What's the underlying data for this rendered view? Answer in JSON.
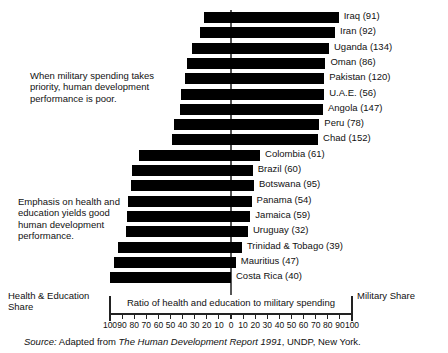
{
  "chart_data": {
    "type": "bar",
    "title": "",
    "subtitle": "",
    "orientation": "horizontal-diverging",
    "xlabel": "Ratio of health and education to military spending",
    "ylabel": "",
    "xlim": [
      -100,
      100
    ],
    "grid": false,
    "legend": "none",
    "axis_note_left": "Health & Education\nShare",
    "axis_note_right": "Military Share",
    "tick_labels": [
      "100",
      "90",
      "80",
      "70",
      "60",
      "50",
      "40",
      "30",
      "20",
      "10",
      "0",
      "10",
      "20",
      "30",
      "40",
      "50",
      "60",
      "70",
      "80",
      "90",
      "100"
    ],
    "tick_values": [
      -100,
      -90,
      -80,
      -70,
      -60,
      -50,
      -40,
      -30,
      -20,
      -10,
      0,
      10,
      20,
      30,
      40,
      50,
      60,
      70,
      80,
      90,
      100
    ],
    "series_note": "Bars extending right indicate a larger military share; bars extending left indicate a larger health & education share. Number in parentheses is the country's human development rank.",
    "categories": [
      "Iraq (91)",
      "Iran (92)",
      "Uganda (134)",
      "Oman (86)",
      "Pakistan (120)",
      "U.A.E. (56)",
      "Angola (147)",
      "Peru (78)",
      "Chad (152)",
      "Colombia (61)",
      "Brazil (60)",
      "Botswana (95)",
      "Panama (54)",
      "Jamaica (59)",
      "Uruguay (32)",
      "Trinidad & Tobago (39)",
      "Mauritius (47)",
      "Costa Rica (40)"
    ],
    "points": [
      {
        "label": "Iraq (91)",
        "country": "Iraq",
        "rank": 91,
        "left": -22,
        "right": 89,
        "group": "military"
      },
      {
        "label": "Iran (92)",
        "country": "Iran",
        "rank": 92,
        "left": -26,
        "right": 86,
        "group": "military"
      },
      {
        "label": "Uganda (134)",
        "country": "Uganda",
        "rank": 134,
        "left": -32,
        "right": 81,
        "group": "military"
      },
      {
        "label": "Oman (86)",
        "country": "Oman",
        "rank": 86,
        "left": -36,
        "right": 78,
        "group": "military"
      },
      {
        "label": "Pakistan (120)",
        "country": "Pakistan",
        "rank": 120,
        "left": -38,
        "right": 77,
        "group": "military"
      },
      {
        "label": "U.A.E. (56)",
        "country": "U.A.E.",
        "rank": 56,
        "left": -41,
        "right": 77,
        "group": "military"
      },
      {
        "label": "Angola (147)",
        "country": "Angola",
        "rank": 147,
        "left": -42,
        "right": 76,
        "group": "military"
      },
      {
        "label": "Peru (78)",
        "country": "Peru",
        "rank": 78,
        "left": -47,
        "right": 73,
        "group": "military"
      },
      {
        "label": "Chad (152)",
        "country": "Chad",
        "rank": 152,
        "left": -49,
        "right": 72,
        "group": "military"
      },
      {
        "label": "Colombia (61)",
        "country": "Colombia",
        "rank": 61,
        "left": -76,
        "right": 24,
        "group": "health"
      },
      {
        "label": "Brazil (60)",
        "country": "Brazil",
        "rank": 60,
        "left": -82,
        "right": 18,
        "group": "health"
      },
      {
        "label": "Botswana (95)",
        "country": "Botswana",
        "rank": 95,
        "left": -83,
        "right": 19,
        "group": "health"
      },
      {
        "label": "Panama (54)",
        "country": "Panama",
        "rank": 54,
        "left": -85,
        "right": 17,
        "group": "health"
      },
      {
        "label": "Jamaica (59)",
        "country": "Jamaica",
        "rank": 59,
        "left": -86,
        "right": 16,
        "group": "health"
      },
      {
        "label": "Uruguay (32)",
        "country": "Uruguay",
        "rank": 32,
        "left": -87,
        "right": 14,
        "group": "health"
      },
      {
        "label": "Trinidad & Tobago (39)",
        "country": "Trinidad & Tobago",
        "rank": 39,
        "left": -93,
        "right": 9,
        "group": "health"
      },
      {
        "label": "Mauritius (47)",
        "country": "Mauritius",
        "rank": 47,
        "left": -97,
        "right": 4,
        "group": "health"
      },
      {
        "label": "Costa Rica (40)",
        "country": "Costa Rica",
        "rank": 40,
        "left": -100,
        "right": 0,
        "group": "health"
      }
    ],
    "colors": {
      "bar": "#000000",
      "zero_line": "#555555",
      "axis": "#222222",
      "text": "#111111",
      "background": "#ffffff"
    }
  },
  "annotations": {
    "military": "When military spending takes\npriority, human development\nperformance is poor.",
    "health": "Emphasis on health and\neducation yields good\nhuman development\nperformance."
  },
  "axis": {
    "caption": "Ratio of health and education to military spending",
    "left_label": "Health & Education\nShare",
    "right_label": "Military Share"
  },
  "source": {
    "prefix": "Source:",
    "text_before": " Adapted from ",
    "title": "The Human Development Report 1991",
    "text_after": ", UNDP, New York."
  }
}
